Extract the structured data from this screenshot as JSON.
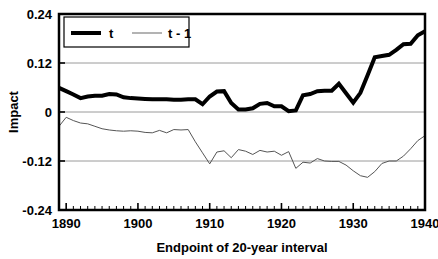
{
  "chart_data": {
    "type": "line",
    "title": "",
    "xlabel": "Endpoint of 20-year interval",
    "ylabel": "Impact",
    "xlim": [
      1889,
      1940
    ],
    "ylim": [
      -0.24,
      0.24
    ],
    "yticks": [
      "0.24",
      "0.12",
      "0",
      "-0.12",
      "-0.24"
    ],
    "ytick_values": [
      0.24,
      0.12,
      0,
      -0.12,
      -0.24
    ],
    "xticks": [
      "1890",
      "1900",
      "1910",
      "1920",
      "1930",
      "1940"
    ],
    "xtick_values": [
      1890,
      1900,
      1910,
      1920,
      1930,
      1940
    ],
    "xtick_minor_step": 1,
    "grid": "horizontal",
    "legend_position": "top-left",
    "series": [
      {
        "name": "t",
        "style": "thick-black",
        "color": "#000000",
        "width": 4,
        "x": [
          1889,
          1890,
          1891,
          1892,
          1893,
          1894,
          1895,
          1896,
          1897,
          1898,
          1899,
          1900,
          1901,
          1902,
          1903,
          1904,
          1905,
          1906,
          1907,
          1908,
          1909,
          1910,
          1911,
          1912,
          1913,
          1914,
          1915,
          1916,
          1917,
          1918,
          1919,
          1920,
          1921,
          1922,
          1923,
          1924,
          1925,
          1926,
          1927,
          1928,
          1929,
          1930,
          1931,
          1932,
          1933,
          1934,
          1935,
          1936,
          1937,
          1938,
          1939,
          1940
        ],
        "values": [
          0.059,
          0.051,
          0.043,
          0.034,
          0.038,
          0.04,
          0.04,
          0.044,
          0.043,
          0.036,
          0.034,
          0.033,
          0.032,
          0.031,
          0.031,
          0.031,
          0.03,
          0.03,
          0.031,
          0.031,
          0.019,
          0.038,
          0.05,
          0.051,
          0.022,
          0.006,
          0.006,
          0.009,
          0.02,
          0.022,
          0.014,
          0.014,
          0.002,
          0.004,
          0.041,
          0.044,
          0.051,
          0.052,
          0.052,
          0.069,
          0.046,
          0.023,
          0.047,
          0.09,
          0.134,
          0.137,
          0.14,
          0.152,
          0.166,
          0.167,
          0.188,
          0.198
        ]
      },
      {
        "name": "t - 1",
        "style": "thin-gray",
        "color": "#555555",
        "width": 1,
        "x": [
          1889,
          1890,
          1891,
          1892,
          1893,
          1894,
          1895,
          1896,
          1897,
          1898,
          1899,
          1900,
          1901,
          1902,
          1903,
          1904,
          1905,
          1906,
          1907,
          1908,
          1909,
          1910,
          1911,
          1912,
          1913,
          1914,
          1915,
          1916,
          1917,
          1918,
          1919,
          1920,
          1921,
          1922,
          1923,
          1924,
          1925,
          1926,
          1927,
          1928,
          1929,
          1930,
          1931,
          1932,
          1933,
          1934,
          1935,
          1936,
          1937,
          1938,
          1939,
          1940
        ],
        "values": [
          -0.035,
          -0.013,
          -0.021,
          -0.027,
          -0.029,
          -0.035,
          -0.041,
          -0.044,
          -0.046,
          -0.047,
          -0.046,
          -0.047,
          -0.05,
          -0.051,
          -0.045,
          -0.051,
          -0.043,
          -0.044,
          -0.043,
          -0.073,
          -0.1,
          -0.127,
          -0.098,
          -0.095,
          -0.112,
          -0.092,
          -0.096,
          -0.104,
          -0.094,
          -0.098,
          -0.096,
          -0.106,
          -0.097,
          -0.138,
          -0.123,
          -0.125,
          -0.114,
          -0.12,
          -0.121,
          -0.121,
          -0.13,
          -0.144,
          -0.156,
          -0.16,
          -0.146,
          -0.126,
          -0.12,
          -0.12,
          -0.108,
          -0.09,
          -0.07,
          -0.058
        ]
      }
    ]
  },
  "legend": {
    "entries": [
      {
        "label": "t",
        "color": "#000000"
      },
      {
        "label": "t - 1",
        "color": "#808080"
      }
    ]
  },
  "axes": {
    "y_label": "Impact",
    "x_label": "Endpoint of 20-year interval"
  }
}
